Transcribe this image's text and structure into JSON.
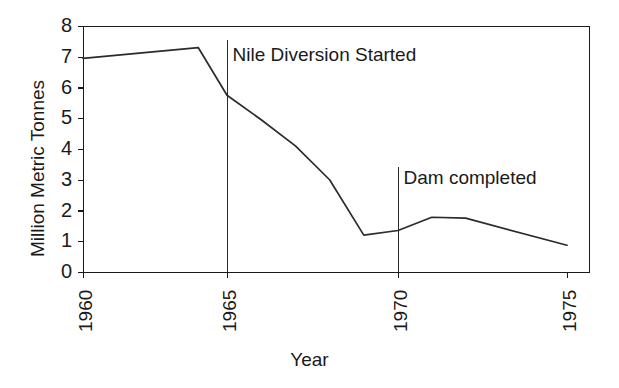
{
  "chart_data": {
    "type": "line",
    "title": "",
    "xlabel": "Year",
    "ylabel": "Million Metric Tonnes",
    "xlim": [
      1960,
      1975
    ],
    "ylim": [
      0,
      8
    ],
    "grid": false,
    "legend": "none",
    "x_tick_labels": [
      "1960",
      "1965",
      "1970",
      "1975"
    ],
    "x_tick_values": [
      1960,
      1965,
      1970,
      1975
    ],
    "y_tick_labels": [
      "0",
      "1",
      "2",
      "3",
      "4",
      "5",
      "6",
      "7",
      "8"
    ],
    "y_tick_values": [
      0,
      1,
      2,
      3,
      4,
      5,
      6,
      7,
      8
    ],
    "x_tick_label_rotation": -90,
    "series": [
      {
        "name": "Sardine catch",
        "color": "#2b2b2b",
        "x": [
          1960,
          1964,
          1965,
          1966,
          1967,
          1968,
          1969,
          1970,
          1971,
          1972,
          1975
        ],
        "values": [
          6.95,
          7.3,
          5.75,
          4.95,
          4.1,
          3.0,
          1.2,
          1.35,
          1.78,
          1.75,
          0.87
        ]
      }
    ],
    "annotations": [
      {
        "label": "Nile Diversion Started",
        "x": 1965,
        "line_top_value": 7.55,
        "line_bottom_value": 0,
        "label_value": 7.05
      },
      {
        "label": "Dam completed",
        "x": 1970,
        "line_top_value": 3.4,
        "line_bottom_value": 0,
        "label_value": 3.05
      }
    ]
  }
}
